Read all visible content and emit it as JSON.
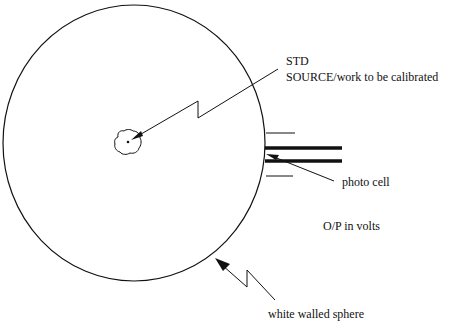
{
  "diagram": {
    "type": "integrating sphere photometer schematic",
    "colors": {
      "stroke": "#111111",
      "background": "#ffffff"
    },
    "labels": {
      "std": "STD",
      "source": "SOURCE/work to be calibrated",
      "photo_cell": "photo cell",
      "output": "O/P in volts",
      "sphere": "white walled sphere"
    },
    "components": [
      "white walled sphere",
      "STD SOURCE/work to be calibrated",
      "photo cell",
      "O/P in volts"
    ]
  }
}
